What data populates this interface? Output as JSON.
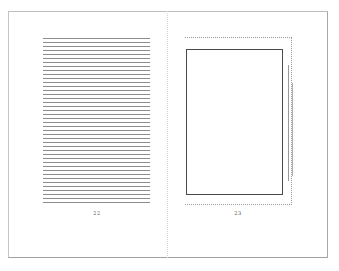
{
  "spread": {
    "left_page": {
      "page_number": "22",
      "content_type": "text-block",
      "line_count": 42
    },
    "right_page": {
      "page_number": "23",
      "content_type": "image-placeholder",
      "caption_rules": 2
    }
  }
}
